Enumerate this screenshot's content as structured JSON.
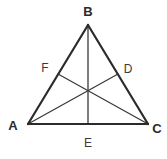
{
  "figure": {
    "type": "geometry-diagram",
    "canvas": {
      "width": 167,
      "height": 159,
      "background": "#ffffff"
    },
    "style": {
      "side_color": "#2b2b2b",
      "side_width": 2.2,
      "median_color": "#3a3a3a",
      "median_width": 1.3,
      "label_color": "#2a2a2a"
    },
    "points": {
      "A": {
        "label": "A",
        "x": 28,
        "y": 124,
        "label_x": 13,
        "label_y": 125,
        "kind": "vertex"
      },
      "B": {
        "label": "B",
        "x": 88,
        "y": 25,
        "label_x": 88,
        "label_y": 11,
        "kind": "vertex"
      },
      "C": {
        "label": "C",
        "x": 148,
        "y": 124,
        "label_x": 157,
        "label_y": 128,
        "kind": "vertex"
      },
      "D": {
        "label": "D",
        "x": 118,
        "y": 74,
        "label_x": 128,
        "label_y": 69,
        "kind": "midpoint"
      },
      "E": {
        "label": "E",
        "x": 88,
        "y": 124,
        "label_x": 88,
        "label_y": 143,
        "kind": "midpoint"
      },
      "F": {
        "label": "F",
        "x": 58,
        "y": 74,
        "label_x": 45,
        "label_y": 68,
        "kind": "midpoint"
      },
      "G": {
        "label": "",
        "x": 88,
        "y": 91,
        "kind": "centroid"
      }
    },
    "sides": [
      {
        "name": "side-AB",
        "from": "A",
        "to": "B"
      },
      {
        "name": "side-BC",
        "from": "B",
        "to": "C"
      },
      {
        "name": "side-CA",
        "from": "C",
        "to": "A"
      }
    ],
    "medians": [
      {
        "name": "median-AD",
        "from": "A",
        "to": "D"
      },
      {
        "name": "median-BE",
        "from": "B",
        "to": "E"
      },
      {
        "name": "median-CF",
        "from": "C",
        "to": "F"
      }
    ]
  }
}
